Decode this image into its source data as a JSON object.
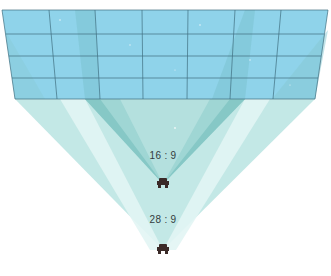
{
  "diagram": {
    "colors": {
      "screen_fill": "#8fd3ea",
      "screen_grid": "#3f6f80",
      "cone_light": "#c3e8e6",
      "cone_mid": "#9fd6d4",
      "cone_dark": "#82c6c4",
      "highlight": "#e4f6f5",
      "projector": "#3a2a28"
    },
    "screen": {
      "top_left": [
        2,
        10
      ],
      "top_right": [
        328,
        10
      ],
      "bottom_left": [
        15,
        99
      ],
      "bottom_right": [
        315,
        99
      ],
      "columns": 7,
      "rows": 4
    },
    "projectors": [
      {
        "id": "projector-16-9",
        "label": "16 : 9",
        "x": 163,
        "y": 184,
        "label_y": 150
      },
      {
        "id": "projector-28-9",
        "label": "28 : 9",
        "x": 163,
        "y": 250,
        "label_y": 214
      }
    ]
  }
}
